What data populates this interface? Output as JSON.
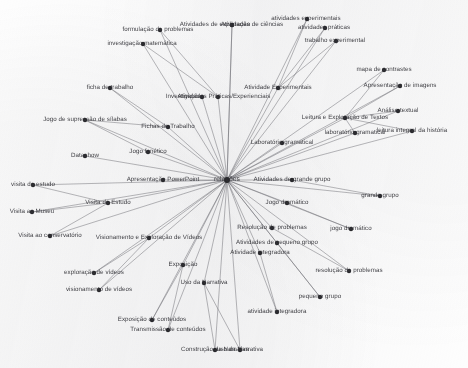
{
  "diagram": {
    "type": "radial-network",
    "background_color": "#fdfdfd",
    "node_color": "#2b2b2f",
    "edge_color": "#6e6e74",
    "center": {
      "x": 227,
      "y": 180,
      "label": "relações"
    },
    "nodes": [
      {
        "id": "n01",
        "label": "Atividades de exploração",
        "x": 232,
        "y": 25,
        "lx": 215,
        "ly": 25,
        "anchor": "center"
      },
      {
        "id": "n02",
        "label": "Atividades de ciências",
        "x": 232,
        "y": 25,
        "lx": 252,
        "ly": 25,
        "anchor": "center"
      },
      {
        "id": "n03",
        "label": "formulação de problemas",
        "x": 160,
        "y": 30,
        "lx": 158,
        "ly": 30,
        "anchor": "center"
      },
      {
        "id": "n04",
        "label": "investigação matemática",
        "x": 143,
        "y": 44,
        "lx": 142,
        "ly": 44,
        "anchor": "center"
      },
      {
        "id": "n05",
        "label": "atividades experimentais",
        "x": 307,
        "y": 19,
        "lx": 306,
        "ly": 19,
        "anchor": "center"
      },
      {
        "id": "n06",
        "label": "atividades práticas",
        "x": 325,
        "y": 28,
        "lx": 324,
        "ly": 28,
        "anchor": "center"
      },
      {
        "id": "n07",
        "label": "trabalho experimental",
        "x": 336,
        "y": 41,
        "lx": 335,
        "ly": 41,
        "anchor": "center"
      },
      {
        "id": "n08",
        "label": "mapa de contrastes",
        "x": 384,
        "y": 70,
        "lx": 384,
        "ly": 70,
        "anchor": "center"
      },
      {
        "id": "n09",
        "label": "Apresentação de imagens",
        "x": 400,
        "y": 86,
        "lx": 400,
        "ly": 86,
        "anchor": "center"
      },
      {
        "id": "n10",
        "label": "Análise textual",
        "x": 398,
        "y": 111,
        "lx": 398,
        "ly": 111,
        "anchor": "center"
      },
      {
        "id": "n11",
        "label": "ficha de trabalho",
        "x": 110,
        "y": 88,
        "lx": 110,
        "ly": 88,
        "anchor": "center"
      },
      {
        "id": "n12",
        "label": "Atividade Experimentais",
        "x": 278,
        "y": 88,
        "lx": 278,
        "ly": 88,
        "anchor": "center"
      },
      {
        "id": "n13",
        "label": "Investigações",
        "x": 202,
        "y": 97,
        "lx": 185,
        "ly": 97,
        "anchor": "center"
      },
      {
        "id": "n14",
        "label": "Atividades Práticas/Experienciais",
        "x": 218,
        "y": 97,
        "lx": 224,
        "ly": 97,
        "anchor": "center"
      },
      {
        "id": "n15",
        "label": "Leitura e Exploração de Textos",
        "x": 345,
        "y": 118,
        "lx": 345,
        "ly": 118,
        "anchor": "center"
      },
      {
        "id": "n16",
        "label": "Jogo de supressão de sílabas",
        "x": 85,
        "y": 120,
        "lx": 85,
        "ly": 120,
        "anchor": "center"
      },
      {
        "id": "n17",
        "label": "Fichas de Trabalho",
        "x": 168,
        "y": 127,
        "lx": 168,
        "ly": 127,
        "anchor": "center"
      },
      {
        "id": "n18",
        "label": "laboratório gramatical",
        "x": 355,
        "y": 133,
        "lx": 355,
        "ly": 133,
        "anchor": "center"
      },
      {
        "id": "n19",
        "label": "leitura integral da história",
        "x": 412,
        "y": 131,
        "lx": 412,
        "ly": 131,
        "anchor": "center"
      },
      {
        "id": "n20",
        "label": "Laboratório gramatical",
        "x": 282,
        "y": 143,
        "lx": 282,
        "ly": 143,
        "anchor": "center"
      },
      {
        "id": "n21",
        "label": "Datashow",
        "x": 85,
        "y": 156,
        "lx": 85,
        "ly": 156,
        "anchor": "center"
      },
      {
        "id": "n22",
        "label": "Jogo fonético",
        "x": 148,
        "y": 152,
        "lx": 148,
        "ly": 152,
        "anchor": "center"
      },
      {
        "id": "n23",
        "label": "Apresentação PowerPoint",
        "x": 163,
        "y": 180,
        "lx": 163,
        "ly": 180,
        "anchor": "center"
      },
      {
        "id": "n24",
        "label": "Atividades de grande grupo",
        "x": 292,
        "y": 180,
        "lx": 292,
        "ly": 180,
        "anchor": "center"
      },
      {
        "id": "n25",
        "label": "grande grupo",
        "x": 380,
        "y": 196,
        "lx": 380,
        "ly": 196,
        "anchor": "center"
      },
      {
        "id": "n26",
        "label": "visita de estudo",
        "x": 33,
        "y": 185,
        "lx": 33,
        "ly": 185,
        "anchor": "center"
      },
      {
        "id": "n27",
        "label": "Visita de Estudo",
        "x": 108,
        "y": 203,
        "lx": 108,
        "ly": 203,
        "anchor": "center"
      },
      {
        "id": "n28",
        "label": "Visita ao Museu",
        "x": 32,
        "y": 212,
        "lx": 32,
        "ly": 212,
        "anchor": "center"
      },
      {
        "id": "n29",
        "label": "Jogo dramático",
        "x": 287,
        "y": 203,
        "lx": 287,
        "ly": 203,
        "anchor": "center"
      },
      {
        "id": "n30",
        "label": "jogo dramático",
        "x": 351,
        "y": 229,
        "lx": 351,
        "ly": 229,
        "anchor": "center"
      },
      {
        "id": "n31",
        "label": "Visita ao conservatório",
        "x": 50,
        "y": 236,
        "lx": 50,
        "ly": 236,
        "anchor": "center"
      },
      {
        "id": "n32",
        "label": "Visionamento e Exploração de Vídeos",
        "x": 149,
        "y": 238,
        "lx": 149,
        "ly": 238,
        "anchor": "center"
      },
      {
        "id": "n33",
        "label": "Resolução de problemas",
        "x": 272,
        "y": 228,
        "lx": 272,
        "ly": 228,
        "anchor": "center"
      },
      {
        "id": "n34",
        "label": "Atividades de pequeno grupo",
        "x": 277,
        "y": 243,
        "lx": 277,
        "ly": 243,
        "anchor": "center"
      },
      {
        "id": "n35",
        "label": "Atividade integradora",
        "x": 260,
        "y": 253,
        "lx": 260,
        "ly": 253,
        "anchor": "center"
      },
      {
        "id": "n36",
        "label": "resolução de problemas",
        "x": 349,
        "y": 271,
        "lx": 349,
        "ly": 271,
        "anchor": "center"
      },
      {
        "id": "n37",
        "label": "Exposição",
        "x": 183,
        "y": 265,
        "lx": 183,
        "ly": 265,
        "anchor": "center"
      },
      {
        "id": "n38",
        "label": "exploração de vídeos",
        "x": 94,
        "y": 273,
        "lx": 94,
        "ly": 273,
        "anchor": "center"
      },
      {
        "id": "n39",
        "label": "visionamento de vídeos",
        "x": 99,
        "y": 290,
        "lx": 99,
        "ly": 290,
        "anchor": "center"
      },
      {
        "id": "n40",
        "label": "Uso da Narrativa",
        "x": 204,
        "y": 283,
        "lx": 204,
        "ly": 283,
        "anchor": "center"
      },
      {
        "id": "n41",
        "label": "pequeno grupo",
        "x": 320,
        "y": 297,
        "lx": 320,
        "ly": 297,
        "anchor": "center"
      },
      {
        "id": "n42",
        "label": "atividade integradora",
        "x": 277,
        "y": 312,
        "lx": 277,
        "ly": 312,
        "anchor": "center"
      },
      {
        "id": "n43",
        "label": "Exposição de conteúdos",
        "x": 152,
        "y": 320,
        "lx": 152,
        "ly": 320,
        "anchor": "center"
      },
      {
        "id": "n44",
        "label": "Transmissão de conteúdos",
        "x": 168,
        "y": 330,
        "lx": 168,
        "ly": 330,
        "anchor": "center"
      },
      {
        "id": "n45",
        "label": "Construção da Narrativa",
        "x": 215,
        "y": 350,
        "lx": 215,
        "ly": 350,
        "anchor": "center"
      },
      {
        "id": "n46",
        "label": "uso da Narrativa",
        "x": 240,
        "y": 350,
        "lx": 240,
        "ly": 350,
        "anchor": "center"
      }
    ],
    "edges": [
      {
        "from": "center",
        "to": "n01"
      },
      {
        "from": "center",
        "to": "n02"
      },
      {
        "from": "center",
        "to": "n03"
      },
      {
        "from": "center",
        "to": "n04"
      },
      {
        "from": "center",
        "to": "n05"
      },
      {
        "from": "center",
        "to": "n06"
      },
      {
        "from": "center",
        "to": "n07"
      },
      {
        "from": "center",
        "to": "n08"
      },
      {
        "from": "center",
        "to": "n09"
      },
      {
        "from": "center",
        "to": "n10"
      },
      {
        "from": "center",
        "to": "n11"
      },
      {
        "from": "center",
        "to": "n12"
      },
      {
        "from": "center",
        "to": "n13"
      },
      {
        "from": "center",
        "to": "n14"
      },
      {
        "from": "center",
        "to": "n15"
      },
      {
        "from": "center",
        "to": "n16"
      },
      {
        "from": "center",
        "to": "n17"
      },
      {
        "from": "center",
        "to": "n18"
      },
      {
        "from": "center",
        "to": "n19"
      },
      {
        "from": "center",
        "to": "n20"
      },
      {
        "from": "center",
        "to": "n21"
      },
      {
        "from": "center",
        "to": "n22"
      },
      {
        "from": "center",
        "to": "n23"
      },
      {
        "from": "center",
        "to": "n24"
      },
      {
        "from": "center",
        "to": "n25"
      },
      {
        "from": "center",
        "to": "n26"
      },
      {
        "from": "center",
        "to": "n27"
      },
      {
        "from": "center",
        "to": "n28"
      },
      {
        "from": "center",
        "to": "n29"
      },
      {
        "from": "center",
        "to": "n30"
      },
      {
        "from": "center",
        "to": "n31"
      },
      {
        "from": "center",
        "to": "n32"
      },
      {
        "from": "center",
        "to": "n33"
      },
      {
        "from": "center",
        "to": "n34"
      },
      {
        "from": "center",
        "to": "n35"
      },
      {
        "from": "center",
        "to": "n36"
      },
      {
        "from": "center",
        "to": "n37"
      },
      {
        "from": "center",
        "to": "n38"
      },
      {
        "from": "center",
        "to": "n39"
      },
      {
        "from": "center",
        "to": "n40"
      },
      {
        "from": "center",
        "to": "n41"
      },
      {
        "from": "center",
        "to": "n42"
      },
      {
        "from": "center",
        "to": "n43"
      },
      {
        "from": "center",
        "to": "n44"
      },
      {
        "from": "center",
        "to": "n45"
      },
      {
        "from": "center",
        "to": "n46"
      },
      {
        "from": "n12",
        "to": "n05"
      },
      {
        "from": "n12",
        "to": "n06"
      },
      {
        "from": "n12",
        "to": "n07"
      },
      {
        "from": "n15",
        "to": "n08"
      },
      {
        "from": "n15",
        "to": "n09"
      },
      {
        "from": "n15",
        "to": "n10"
      },
      {
        "from": "n15",
        "to": "n19"
      },
      {
        "from": "n15",
        "to": "n18"
      },
      {
        "from": "n14",
        "to": "n03"
      },
      {
        "from": "n14",
        "to": "n04"
      },
      {
        "from": "n24",
        "to": "n25"
      },
      {
        "from": "n29",
        "to": "n30"
      },
      {
        "from": "n33",
        "to": "n36"
      },
      {
        "from": "n34",
        "to": "n41"
      },
      {
        "from": "n35",
        "to": "n42"
      },
      {
        "from": "n37",
        "to": "n43"
      },
      {
        "from": "n37",
        "to": "n44"
      },
      {
        "from": "n32",
        "to": "n38"
      },
      {
        "from": "n32",
        "to": "n39"
      },
      {
        "from": "n27",
        "to": "n26"
      },
      {
        "from": "n27",
        "to": "n28"
      },
      {
        "from": "n27",
        "to": "n31"
      },
      {
        "from": "n40",
        "to": "n45"
      },
      {
        "from": "n40",
        "to": "n46"
      },
      {
        "from": "n17",
        "to": "n11"
      },
      {
        "from": "n17",
        "to": "n16"
      },
      {
        "from": "n22",
        "to": "n16"
      }
    ]
  }
}
